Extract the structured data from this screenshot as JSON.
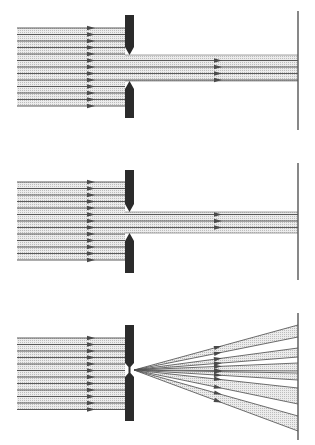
{
  "diagram": {
    "colors": {
      "background": "#ffffff",
      "ray": "#4a4a4a",
      "beam_fill": "#d9d9d9",
      "blade": "#2b2b2b",
      "screen": "#555555"
    },
    "panels": [
      {
        "id": "wide-slit",
        "ray_x_start": 17,
        "arrow_x": 91,
        "blade_x": 125,
        "blade_w": 9,
        "ray_y_top": 28,
        "ray_count": 13,
        "ray_step": 6.5,
        "blade_top": 15,
        "slit_top": 55,
        "slit_bottom": 81,
        "blade_bottom": 118,
        "screen_x": 298,
        "screen_top": 11,
        "screen_bottom": 130,
        "transmitted_arrow_x": 218,
        "mode": "parallel"
      },
      {
        "id": "narrow-slit",
        "ray_x_start": 17,
        "arrow_x": 91,
        "blade_x": 125,
        "blade_w": 9,
        "ray_y_top": 182,
        "ray_count": 13,
        "ray_step": 6.5,
        "blade_top": 170,
        "slit_top": 212,
        "slit_bottom": 233,
        "blade_bottom": 273,
        "screen_x": 298,
        "screen_top": 163,
        "screen_bottom": 280,
        "transmitted_arrow_x": 218,
        "mode": "parallel"
      },
      {
        "id": "pinhole-slit",
        "ray_x_start": 17,
        "arrow_x": 91,
        "blade_x": 125,
        "blade_w": 9,
        "ray_y_top": 338,
        "ray_count": 12,
        "ray_step": 6.5,
        "blade_top": 325,
        "slit_top": 366,
        "slit_bottom": 374,
        "blade_bottom": 421,
        "screen_x": 298,
        "screen_top": 313,
        "screen_bottom": 440,
        "transmitted_arrow_x": 218,
        "mode": "fan",
        "fan_origin_y": 370,
        "fan_bands": [
          {
            "y1": 325,
            "y2": 337
          },
          {
            "y1": 348,
            "y2": 357
          },
          {
            "y1": 363,
            "y2": 371
          },
          {
            "y1": 373,
            "y2": 380
          },
          {
            "y1": 388,
            "y2": 404
          },
          {
            "y1": 416,
            "y2": 431
          }
        ]
      }
    ]
  }
}
